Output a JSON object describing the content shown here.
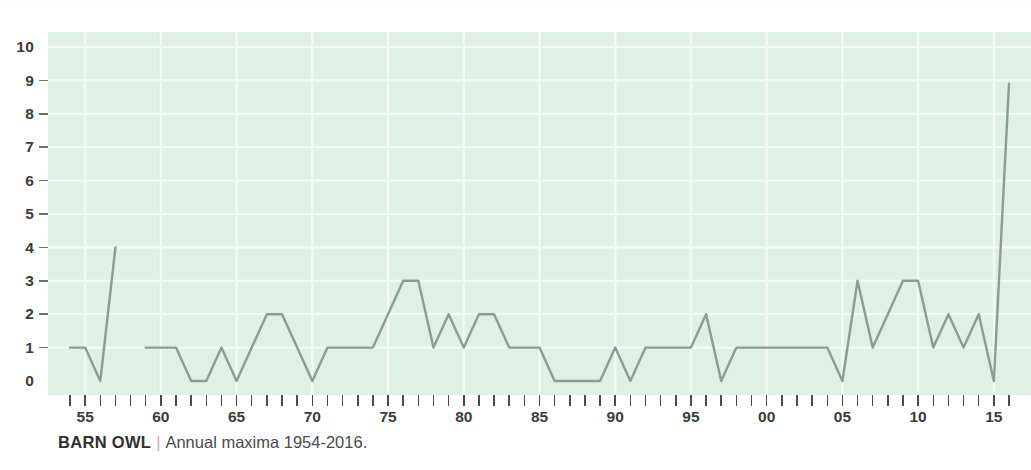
{
  "caption": {
    "title": "BARN OWL",
    "separator": "|",
    "subtitle": "Annual maxima 1954-2016."
  },
  "chart_data": {
    "type": "line",
    "title": "BARN OWL",
    "subtitle": "Annual maxima 1954-2016.",
    "xlabel": "",
    "ylabel": "",
    "ylim": [
      0,
      10
    ],
    "xlim": [
      1954,
      2016
    ],
    "grid": true,
    "legend_position": "none",
    "plot_background": "#dff0e4",
    "line_color": "#8b9d93",
    "gridline_color": "#f4fbf6",
    "y_ticks": [
      0,
      1,
      2,
      3,
      4,
      5,
      6,
      7,
      8,
      9,
      10
    ],
    "y_tick_labels": [
      "0",
      "1",
      "2",
      "3",
      "4",
      "5",
      "6",
      "7",
      "8",
      "9",
      "10"
    ],
    "x_tick_years": [
      1954,
      1955,
      1956,
      1957,
      1958,
      1959,
      1960,
      1961,
      1962,
      1963,
      1964,
      1965,
      1966,
      1967,
      1968,
      1969,
      1970,
      1971,
      1972,
      1973,
      1974,
      1975,
      1976,
      1977,
      1978,
      1979,
      1980,
      1981,
      1982,
      1983,
      1984,
      1985,
      1986,
      1987,
      1988,
      1989,
      1990,
      1991,
      1992,
      1993,
      1994,
      1995,
      1996,
      1997,
      1998,
      1999,
      2000,
      2001,
      2002,
      2003,
      2004,
      2005,
      2006,
      2007,
      2008,
      2009,
      2010,
      2011,
      2012,
      2013,
      2014,
      2015,
      2016
    ],
    "x_labelled_years": [
      1955,
      1960,
      1965,
      1970,
      1975,
      1980,
      1985,
      1990,
      1995,
      2000,
      2005,
      2010,
      2015
    ],
    "x_tick_labels": [
      "55",
      "60",
      "65",
      "70",
      "75",
      "80",
      "85",
      "90",
      "95",
      "00",
      "05",
      "10",
      "15"
    ],
    "series": [
      {
        "name": "Annual maxima",
        "x": [
          1954,
          1955,
          1956,
          1957,
          1959,
          1960,
          1961,
          1962,
          1963,
          1964,
          1965,
          1966,
          1967,
          1968,
          1969,
          1970,
          1971,
          1972,
          1973,
          1974,
          1975,
          1976,
          1977,
          1978,
          1979,
          1980,
          1981,
          1982,
          1983,
          1984,
          1985,
          1986,
          1987,
          1988,
          1989,
          1990,
          1991,
          1992,
          1993,
          1994,
          1995,
          1996,
          1997,
          1998,
          1999,
          2000,
          2001,
          2002,
          2003,
          2004,
          2005,
          2006,
          2007,
          2008,
          2009,
          2010,
          2011,
          2012,
          2013,
          2014,
          2015,
          2016
        ],
        "values": [
          1,
          1,
          0,
          4,
          1,
          1,
          1,
          0,
          0,
          1,
          0,
          1,
          2,
          2,
          1,
          0,
          1,
          1,
          1,
          1,
          2,
          3,
          3,
          1,
          2,
          1,
          2,
          2,
          1,
          1,
          1,
          0,
          0,
          0,
          0,
          1,
          0,
          1,
          1,
          1,
          1,
          2,
          0,
          1,
          1,
          1,
          1,
          1,
          1,
          1,
          0,
          3,
          1,
          2,
          3,
          3,
          1,
          2,
          1,
          2,
          0,
          8.9
        ]
      }
    ],
    "gaps": [
      1958
    ]
  }
}
